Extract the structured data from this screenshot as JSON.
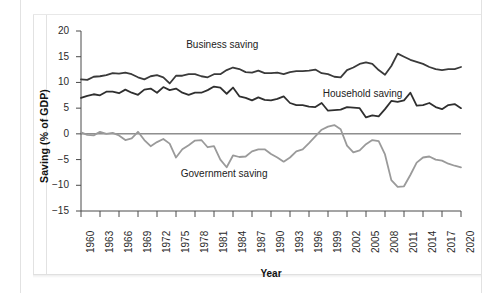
{
  "chart_data": {
    "type": "line",
    "title": "",
    "xlabel": "Year",
    "ylabel": "Saving (% of GDP)",
    "xlim": [
      1960,
      2020
    ],
    "ylim": [
      -15,
      20
    ],
    "yticks": [
      20,
      15,
      10,
      5,
      0,
      -5,
      -10,
      -15
    ],
    "ytick_labels": [
      "20",
      "15",
      "10",
      "5",
      "0",
      "−5",
      "−10",
      "−15"
    ],
    "xticks": [
      1960,
      1963,
      1966,
      1969,
      1972,
      1975,
      1978,
      1981,
      1984,
      1987,
      1990,
      1993,
      1996,
      1999,
      2002,
      2005,
      2008,
      2011,
      2014,
      2017,
      2020
    ],
    "xtick_labels": [
      "1960",
      "1963",
      "1966",
      "1969",
      "1972",
      "1975",
      "1978",
      "1981",
      "1984",
      "1987",
      "1990",
      "1993",
      "1996",
      "1999",
      "2002",
      "2005",
      "2008",
      "2011",
      "2014",
      "2017",
      "2020"
    ],
    "grid": false,
    "legend_position": "inline-annotations",
    "zero_line": true,
    "x": [
      1960,
      1961,
      1962,
      1963,
      1964,
      1965,
      1966,
      1967,
      1968,
      1969,
      1970,
      1971,
      1972,
      1973,
      1974,
      1975,
      1976,
      1977,
      1978,
      1979,
      1980,
      1981,
      1982,
      1983,
      1984,
      1985,
      1986,
      1987,
      1988,
      1989,
      1990,
      1991,
      1992,
      1993,
      1994,
      1995,
      1996,
      1997,
      1998,
      1999,
      2000,
      2001,
      2002,
      2003,
      2004,
      2005,
      2006,
      2007,
      2008,
      2009,
      2010,
      2011,
      2012,
      2013,
      2014,
      2015,
      2016,
      2017,
      2018,
      2019,
      2020
    ],
    "series": [
      {
        "name": "Business saving",
        "color": "#3a3a3a",
        "values": [
          10.6,
          10.5,
          11.1,
          11.2,
          11.4,
          11.8,
          11.7,
          11.9,
          11.6,
          11.0,
          10.6,
          11.2,
          11.4,
          11.0,
          9.8,
          11.3,
          11.3,
          11.6,
          11.6,
          11.2,
          11.0,
          11.6,
          11.6,
          12.4,
          12.9,
          12.6,
          12.0,
          11.9,
          12.3,
          11.8,
          11.8,
          11.9,
          11.6,
          12.0,
          12.2,
          12.2,
          12.3,
          12.5,
          11.8,
          11.6,
          11.1,
          11.0,
          12.4,
          12.9,
          13.6,
          13.9,
          13.6,
          12.4,
          11.5,
          13.2,
          15.6,
          15.0,
          14.4,
          14.0,
          13.6,
          13.0,
          12.6,
          12.4,
          12.6,
          12.6,
          13.0
        ]
      },
      {
        "name": "Household saving",
        "color": "#2f2f2f",
        "values": [
          7.0,
          7.4,
          7.7,
          7.5,
          8.2,
          8.2,
          7.9,
          8.6,
          8.0,
          7.6,
          8.6,
          8.8,
          8.0,
          9.1,
          8.5,
          8.8,
          8.0,
          7.6,
          8.0,
          8.0,
          8.5,
          9.2,
          9.0,
          7.8,
          9.0,
          7.3,
          7.0,
          6.5,
          7.1,
          6.6,
          6.5,
          6.8,
          7.3,
          6.0,
          5.6,
          5.6,
          5.3,
          5.2,
          6.0,
          4.5,
          4.6,
          4.7,
          5.2,
          5.1,
          5.0,
          3.2,
          3.6,
          3.4,
          4.8,
          6.4,
          6.2,
          6.5,
          8.0,
          5.5,
          5.6,
          6.0,
          5.2,
          4.8,
          5.6,
          5.8,
          5.0
        ]
      },
      {
        "name": "Government saving",
        "color": "#9a9a9a",
        "values": [
          0.3,
          -0.2,
          -0.3,
          0.4,
          0.0,
          0.2,
          -0.3,
          -1.2,
          -0.9,
          0.4,
          -1.2,
          -2.4,
          -1.6,
          -1.0,
          -1.9,
          -4.6,
          -3.0,
          -2.2,
          -1.3,
          -1.2,
          -2.6,
          -2.4,
          -5.0,
          -6.5,
          -4.2,
          -4.5,
          -4.4,
          -3.4,
          -3.0,
          -3.0,
          -3.9,
          -4.6,
          -5.4,
          -4.6,
          -3.4,
          -3.0,
          -1.8,
          -0.5,
          0.8,
          1.4,
          1.7,
          0.9,
          -2.3,
          -3.6,
          -3.2,
          -2.0,
          -1.2,
          -1.4,
          -4.0,
          -9.0,
          -10.3,
          -10.2,
          -8.0,
          -5.6,
          -4.6,
          -4.4,
          -5.0,
          -5.2,
          -5.8,
          -6.2,
          -6.5
        ]
      }
    ],
    "annotations": [
      {
        "text": "Business saving",
        "x": 1983,
        "y": 17.0
      },
      {
        "text": "Household saving",
        "x": 2005,
        "y": 7.6
      },
      {
        "text": "Government saving",
        "x": 1983,
        "y": -8.0
      }
    ]
  }
}
